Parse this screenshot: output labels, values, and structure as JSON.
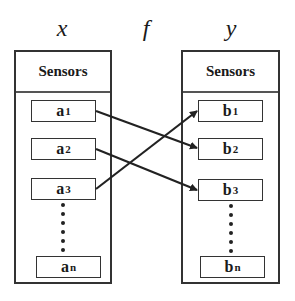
{
  "diagram": {
    "domain_label": "x",
    "function_label": "f",
    "codomain_label": "y",
    "left_box": {
      "header": "Sensors",
      "nodes": [
        {
          "base": "a",
          "sub": "1"
        },
        {
          "base": "a",
          "sub": "2"
        },
        {
          "base": "a",
          "sub": "3"
        },
        {
          "base": "a",
          "sub": "n"
        }
      ]
    },
    "right_box": {
      "header": "Sensors",
      "nodes": [
        {
          "base": "b",
          "sub": "1"
        },
        {
          "base": "b",
          "sub": "2"
        },
        {
          "base": "b",
          "sub": "3"
        },
        {
          "base": "b",
          "sub": "n"
        }
      ]
    },
    "mappings": [
      {
        "from": "a1",
        "to": "b2"
      },
      {
        "from": "a2",
        "to": "b3"
      },
      {
        "from": "a3",
        "to": "b1"
      }
    ],
    "colors": {
      "stroke": "#222222",
      "background": "#ffffff"
    }
  }
}
